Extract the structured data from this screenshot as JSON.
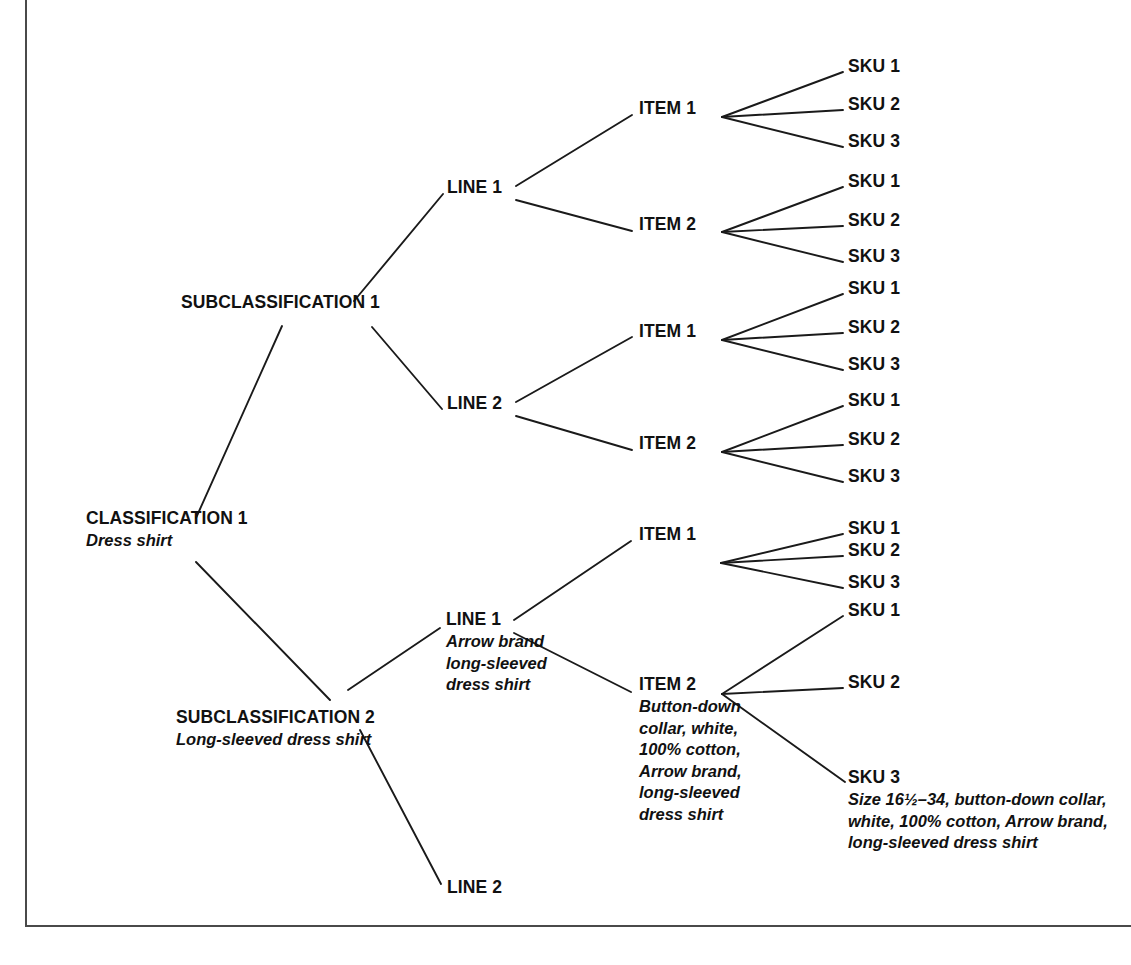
{
  "diagram": {
    "type": "hierarchy-tree",
    "orientation": "left-to-right",
    "levels": [
      "Classification",
      "Subclassification",
      "Line",
      "Item",
      "SKU"
    ],
    "line_color": "#1a1a1a",
    "frame_color": "#4a4a4a",
    "background": "#ffffff"
  },
  "nodes": {
    "classification_1": {
      "title": "CLASSIFICATION 1",
      "desc": "Dress shirt"
    },
    "subclassification_1": {
      "title": "SUBCLASSIFICATION 1",
      "desc": ""
    },
    "subclassification_2": {
      "title": "SUBCLASSIFICATION 2",
      "desc": "Long-sleeved dress shirt"
    },
    "sub1_line1": {
      "title": "LINE 1",
      "desc": ""
    },
    "sub1_line2": {
      "title": "LINE 2",
      "desc": ""
    },
    "sub2_line1": {
      "title": "LINE 1",
      "desc": "Arrow brand long-sleeved dress shirt"
    },
    "sub2_line2": {
      "title": "LINE 2",
      "desc": ""
    },
    "sub1_line1_item1": {
      "title": "ITEM 1",
      "desc": ""
    },
    "sub1_line1_item2": {
      "title": "ITEM 2",
      "desc": ""
    },
    "sub1_line2_item1": {
      "title": "ITEM 1",
      "desc": ""
    },
    "sub1_line2_item2": {
      "title": "ITEM 2",
      "desc": ""
    },
    "sub2_line1_item1": {
      "title": "ITEM 1",
      "desc": ""
    },
    "sub2_line1_item2": {
      "title": "ITEM 2",
      "desc": "Button-down collar, white, 100% cotton, Arrow brand, long-sleeved dress shirt"
    },
    "sku_a1": {
      "title": "SKU 1",
      "desc": ""
    },
    "sku_a2": {
      "title": "SKU 2",
      "desc": ""
    },
    "sku_a3": {
      "title": "SKU 3",
      "desc": ""
    },
    "sku_b1": {
      "title": "SKU 1",
      "desc": ""
    },
    "sku_b2": {
      "title": "SKU 2",
      "desc": ""
    },
    "sku_b3": {
      "title": "SKU 3",
      "desc": ""
    },
    "sku_c1": {
      "title": "SKU 1",
      "desc": ""
    },
    "sku_c2": {
      "title": "SKU 2",
      "desc": ""
    },
    "sku_c3": {
      "title": "SKU 3",
      "desc": ""
    },
    "sku_d1": {
      "title": "SKU 1",
      "desc": ""
    },
    "sku_d2": {
      "title": "SKU 2",
      "desc": ""
    },
    "sku_d3": {
      "title": "SKU 3",
      "desc": ""
    },
    "sku_e1": {
      "title": "SKU 1",
      "desc": ""
    },
    "sku_e2": {
      "title": "SKU 2",
      "desc": ""
    },
    "sku_e3": {
      "title": "SKU 3",
      "desc": ""
    },
    "sku_f1": {
      "title": "SKU 1",
      "desc": ""
    },
    "sku_f2": {
      "title": "SKU 2",
      "desc": ""
    },
    "sku_f3": {
      "title": "SKU 3",
      "desc": "Size 16½–34, button-down collar, white, 100% cotton, Arrow brand, long-sleeved dress shirt"
    }
  }
}
